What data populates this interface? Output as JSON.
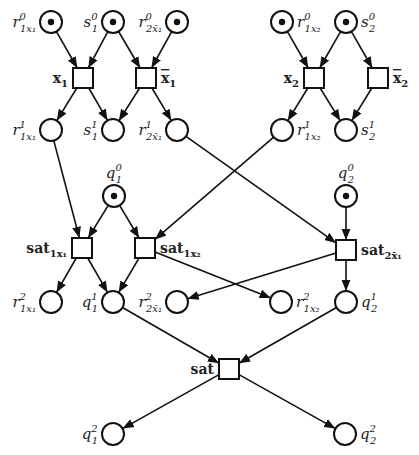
{
  "diagram": {
    "type": "petri-net",
    "colors": {
      "stroke": "#111111",
      "background": "#ffffff"
    },
    "places": [
      {
        "id": "r1x1_0",
        "base": "r",
        "sub": "1x₁",
        "sup": "0",
        "x": 51,
        "y": 22,
        "token": true,
        "label_side": "left"
      },
      {
        "id": "s1_0",
        "base": "s",
        "sub": "1",
        "sup": "0",
        "x": 113,
        "y": 22,
        "token": true,
        "label_side": "left"
      },
      {
        "id": "r2x1bar_0",
        "base": "r",
        "sub": "2x̄₁",
        "sup": "0",
        "x": 177,
        "y": 22,
        "token": true,
        "label_side": "left"
      },
      {
        "id": "r1x2_0",
        "base": "r",
        "sub": "1x₂",
        "sup": "0",
        "x": 282,
        "y": 22,
        "token": true,
        "label_side": "right"
      },
      {
        "id": "s2_0",
        "base": "s",
        "sub": "2",
        "sup": "0",
        "x": 346,
        "y": 22,
        "token": true,
        "label_side": "right"
      },
      {
        "id": "r1x1_1",
        "base": "r",
        "sub": "1x₁",
        "sup": "1",
        "x": 51,
        "y": 130,
        "token": false,
        "label_side": "left"
      },
      {
        "id": "s1_1",
        "base": "s",
        "sub": "1",
        "sup": "1",
        "x": 113,
        "y": 130,
        "token": false,
        "label_side": "left"
      },
      {
        "id": "r2x1bar_1",
        "base": "r",
        "sub": "2x̄₁",
        "sup": "1",
        "x": 177,
        "y": 130,
        "token": false,
        "label_side": "left"
      },
      {
        "id": "r1x2_1",
        "base": "r",
        "sub": "1x₂",
        "sup": "1",
        "x": 282,
        "y": 130,
        "token": false,
        "label_side": "right"
      },
      {
        "id": "s2_1",
        "base": "s",
        "sub": "2",
        "sup": "1",
        "x": 346,
        "y": 130,
        "token": false,
        "label_side": "right"
      },
      {
        "id": "q1_0",
        "base": "q",
        "sub": "1",
        "sup": "0",
        "x": 114,
        "y": 196,
        "token": true,
        "label_side": "top"
      },
      {
        "id": "q2_0",
        "base": "q",
        "sub": "2",
        "sup": "0",
        "x": 346,
        "y": 196,
        "token": true,
        "label_side": "top"
      },
      {
        "id": "r1x1_2",
        "base": "r",
        "sub": "1x₁",
        "sup": "2",
        "x": 51,
        "y": 302,
        "token": false,
        "label_side": "left"
      },
      {
        "id": "q1_1",
        "base": "q",
        "sub": "1",
        "sup": "1",
        "x": 113,
        "y": 302,
        "token": false,
        "label_side": "left"
      },
      {
        "id": "r2x1bar_2",
        "base": "r",
        "sub": "2x̄₁",
        "sup": "2",
        "x": 177,
        "y": 302,
        "token": false,
        "label_side": "left"
      },
      {
        "id": "r1x2_2",
        "base": "r",
        "sub": "1x₂",
        "sup": "2",
        "x": 281,
        "y": 302,
        "token": false,
        "label_side": "right"
      },
      {
        "id": "q2_1",
        "base": "q",
        "sub": "2",
        "sup": "1",
        "x": 346,
        "y": 302,
        "token": false,
        "label_side": "right"
      },
      {
        "id": "q1_2",
        "base": "q",
        "sub": "1",
        "sup": "2",
        "x": 113,
        "y": 434,
        "token": false,
        "label_side": "left"
      },
      {
        "id": "q2_2",
        "base": "q",
        "sub": "2",
        "sup": "2",
        "x": 345,
        "y": 434,
        "token": false,
        "label_side": "right"
      }
    ],
    "transitions": [
      {
        "id": "x1",
        "base": "x",
        "sub": "1",
        "bar": false,
        "x": 83,
        "y": 78,
        "label_side": "left"
      },
      {
        "id": "x1bar",
        "base": "x",
        "sub": "1",
        "bar": true,
        "x": 146,
        "y": 78,
        "label_side": "right"
      },
      {
        "id": "x2",
        "base": "x",
        "sub": "2",
        "bar": false,
        "x": 314,
        "y": 78,
        "label_side": "left"
      },
      {
        "id": "x2bar",
        "base": "x",
        "sub": "2",
        "bar": true,
        "x": 378,
        "y": 78,
        "label_side": "right"
      },
      {
        "id": "sat1x1",
        "base": "sat",
        "sub": "1x₁",
        "bar": false,
        "x": 82,
        "y": 248,
        "label_side": "left"
      },
      {
        "id": "sat1x2",
        "base": "sat",
        "sub": "1x₂",
        "bar": false,
        "x": 145,
        "y": 248,
        "label_side": "right"
      },
      {
        "id": "sat2x1bar",
        "base": "sat",
        "sub": "2x̄₁",
        "bar": false,
        "x": 346,
        "y": 250,
        "label_side": "right"
      },
      {
        "id": "sat",
        "base": "sat",
        "sub": "",
        "bar": false,
        "x": 229,
        "y": 369,
        "label_side": "left"
      }
    ],
    "arcs": [
      [
        "r1x1_0",
        "x1"
      ],
      [
        "s1_0",
        "x1"
      ],
      [
        "s1_0",
        "x1bar"
      ],
      [
        "r2x1bar_0",
        "x1bar"
      ],
      [
        "x1",
        "r1x1_1"
      ],
      [
        "x1",
        "s1_1"
      ],
      [
        "x1bar",
        "s1_1"
      ],
      [
        "x1bar",
        "r2x1bar_1"
      ],
      [
        "r1x2_0",
        "x2"
      ],
      [
        "s2_0",
        "x2"
      ],
      [
        "s2_0",
        "x2bar"
      ],
      [
        "x2",
        "r1x2_1"
      ],
      [
        "x2",
        "s2_1"
      ],
      [
        "x2bar",
        "s2_1"
      ],
      [
        "r1x1_1",
        "sat1x1"
      ],
      [
        "q1_0",
        "sat1x1"
      ],
      [
        "q1_0",
        "sat1x2"
      ],
      [
        "r1x2_1",
        "sat1x2"
      ],
      [
        "r2x1bar_1",
        "sat2x1bar"
      ],
      [
        "q2_0",
        "sat2x1bar"
      ],
      [
        "sat1x1",
        "r1x1_2"
      ],
      [
        "sat1x1",
        "q1_1"
      ],
      [
        "sat1x2",
        "q1_1"
      ],
      [
        "sat1x2",
        "r1x2_2"
      ],
      [
        "sat2x1bar",
        "r2x1bar_2"
      ],
      [
        "sat2x1bar",
        "q2_1"
      ],
      [
        "q1_1",
        "sat"
      ],
      [
        "q2_1",
        "sat"
      ],
      [
        "sat",
        "q1_2"
      ],
      [
        "sat",
        "q2_2"
      ]
    ]
  }
}
